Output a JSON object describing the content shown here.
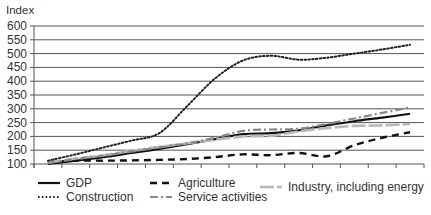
{
  "chart_data": {
    "type": "line",
    "title": "",
    "ylabel": "Index",
    "xlabel": "",
    "ylim": [
      100,
      600
    ],
    "yticks": [
      100,
      150,
      200,
      250,
      300,
      350,
      400,
      450,
      500,
      550,
      600
    ],
    "ytick_labels": [
      "100",
      "150",
      "200",
      "250",
      "300",
      "350",
      "400",
      "450",
      "500",
      "550",
      "600"
    ],
    "num_periods": 14,
    "x": [
      1,
      2,
      3,
      4,
      5,
      6,
      7,
      8,
      9,
      10,
      11,
      12,
      13,
      14
    ],
    "grid": true,
    "legend_position": "bottom",
    "series": [
      {
        "name": "GDP",
        "style": "solid",
        "color": "#111111",
        "values": [
          100,
          112,
          125,
          140,
          155,
          172,
          190,
          208,
          212,
          222,
          240,
          255,
          268,
          282
        ]
      },
      {
        "name": "Agriculture",
        "style": "dashed",
        "color": "#111111",
        "values": [
          107,
          112,
          112,
          113,
          115,
          118,
          125,
          135,
          132,
          140,
          128,
          168,
          195,
          215
        ]
      },
      {
        "name": "Industry, including energy",
        "style": "long-dash-light",
        "color": "#b8b8b8",
        "values": [
          105,
          120,
          132,
          148,
          162,
          175,
          188,
          200,
          202,
          218,
          230,
          238,
          240,
          245
        ]
      },
      {
        "name": "Construction",
        "style": "dotted",
        "color": "#222222",
        "values": [
          112,
          135,
          160,
          185,
          212,
          310,
          410,
          475,
          492,
          478,
          485,
          500,
          515,
          532
        ]
      },
      {
        "name": "Service activities",
        "style": "dash-dot",
        "color": "#888888",
        "values": [
          103,
          118,
          130,
          145,
          160,
          175,
          195,
          220,
          225,
          228,
          245,
          265,
          285,
          305
        ]
      }
    ]
  }
}
